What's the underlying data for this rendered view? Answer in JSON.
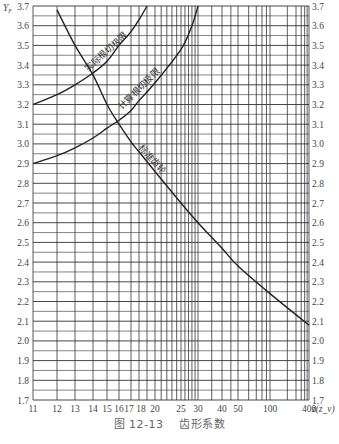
{
  "chart_data": {
    "type": "line",
    "title": "图 12-13 齿形系数",
    "caption": {
      "figure_number": "图 12-13",
      "title": "齿形系数"
    },
    "xlabel": "z(z_v)",
    "ylabel": "Y_F",
    "x_scale": "nonlinear (compressed, approximately 1/z)",
    "xlim": [
      11,
      400
    ],
    "ylim": [
      1.7,
      3.7
    ],
    "grid": true,
    "legend": "none (labels placed along curves)",
    "x_ticks": [
      11,
      12,
      13,
      14,
      15,
      16,
      17,
      18,
      20,
      25,
      30,
      40,
      50,
      100,
      400
    ],
    "x_tick_labels": [
      "11",
      "12",
      "13",
      "14",
      "15",
      "16",
      "17",
      "18",
      "20",
      "25",
      "30",
      "40",
      "50",
      "100",
      "400"
    ],
    "y_ticks": [
      1.7,
      1.8,
      1.9,
      2.0,
      2.1,
      2.2,
      2.3,
      2.4,
      2.5,
      2.6,
      2.7,
      2.8,
      2.9,
      3.0,
      3.1,
      3.2,
      3.3,
      3.4,
      3.5,
      3.6,
      3.7
    ],
    "y_tick_labels": [
      "1.7",
      "1.8",
      "1.9",
      "2.0",
      "2.1",
      "2.2",
      "2.3",
      "2.4",
      "2.5",
      "2.6",
      "2.7",
      "2.8",
      "2.9",
      "3.0",
      "3.1",
      "3.2",
      "3.3",
      "3.4",
      "3.5",
      "3.6",
      "3.7"
    ],
    "series": [
      {
        "name": "实际根切极限",
        "x": [
          11,
          12,
          13,
          14,
          15,
          16,
          17,
          18,
          19
        ],
        "y": [
          3.2,
          3.25,
          3.3,
          3.36,
          3.42,
          3.5,
          3.57,
          3.63,
          3.7
        ]
      },
      {
        "name": "计算根切极限",
        "x": [
          11,
          12,
          13,
          14,
          15,
          16,
          17,
          18,
          20,
          25,
          28,
          30
        ],
        "y": [
          2.9,
          2.94,
          2.98,
          3.03,
          3.08,
          3.12,
          3.17,
          3.22,
          3.31,
          3.48,
          3.6,
          3.7
        ]
      },
      {
        "name": "标准齿轮",
        "x": [
          12,
          13,
          14,
          15,
          16,
          17,
          18,
          20,
          25,
          30,
          40,
          50,
          100,
          400
        ],
        "y": [
          3.68,
          3.5,
          3.35,
          3.2,
          3.1,
          3.01,
          2.96,
          2.86,
          2.7,
          2.6,
          2.47,
          2.38,
          2.24,
          2.08
        ]
      }
    ]
  },
  "colors": {
    "background": "#ffffff",
    "grid": "#333333",
    "curve": "#222222",
    "tick_text": "#444444",
    "caption_text": "#666666"
  }
}
